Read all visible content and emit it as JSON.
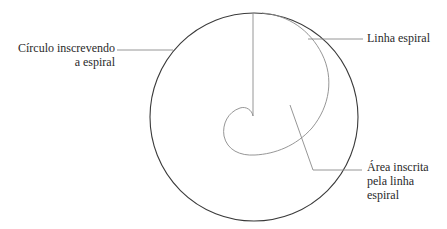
{
  "diagram": {
    "labels": {
      "circle": {
        "line1": "Círculo inscrevendo",
        "line2": "a espiral"
      },
      "spiral": {
        "line1": "Linha espiral"
      },
      "area": {
        "line1": "Área inscrita",
        "line2": "pela linha",
        "line3": "espiral"
      }
    },
    "colors": {
      "circle_stroke": "#3a3a3a",
      "spiral_stroke": "#8a8a8a",
      "leader_stroke": "#8a8a8a",
      "text": "#2a2a2a"
    }
  }
}
